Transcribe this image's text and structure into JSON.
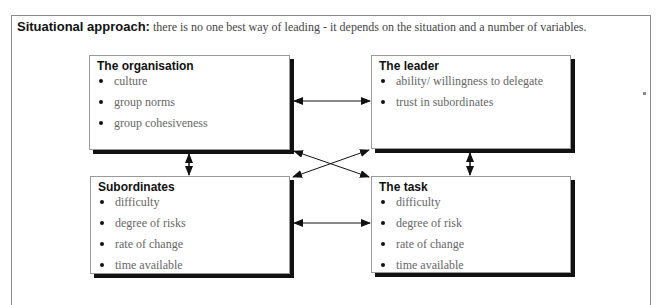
{
  "header": {
    "title_bold": "Situational approach:",
    "title_desc": "there is no one best way of leading - it depends on the situation and a number of variables."
  },
  "boxes": {
    "organisation": {
      "title": "The organisation",
      "items": [
        "culture",
        "group norms",
        "group cohesiveness"
      ]
    },
    "leader": {
      "title": "The leader",
      "items": [
        "ability/ willingness to delegate",
        "trust in subordinates"
      ]
    },
    "subordinates": {
      "title": "Subordinates",
      "items": [
        "difficulty",
        "degree of risks",
        "rate of change",
        "time available"
      ]
    },
    "task": {
      "title": "The task",
      "items": [
        "difficulty",
        "degree of risk",
        "rate of change",
        "time available"
      ]
    }
  },
  "connections": [
    {
      "from": "organisation",
      "to": "leader",
      "type": "bidirectional"
    },
    {
      "from": "organisation",
      "to": "subordinates",
      "type": "bidirectional"
    },
    {
      "from": "leader",
      "to": "task",
      "type": "bidirectional"
    },
    {
      "from": "subordinates",
      "to": "task",
      "type": "bidirectional"
    },
    {
      "from": "organisation",
      "to": "task",
      "type": "bidirectional"
    },
    {
      "from": "leader",
      "to": "subordinates",
      "type": "bidirectional"
    }
  ]
}
